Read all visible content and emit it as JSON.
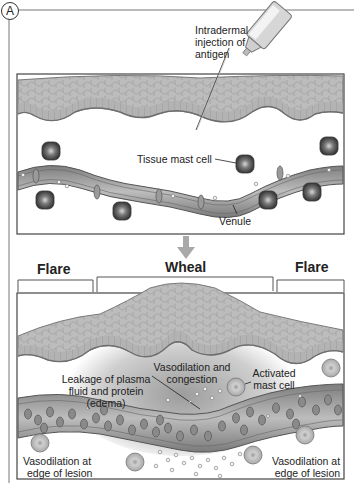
{
  "panel": {
    "letter": "A"
  },
  "top_diagram": {
    "labels": {
      "injection": [
        "Intradermal",
        "injection of",
        "antigen"
      ],
      "mast_cell": "Tissue mast cell",
      "venule": "Venule"
    }
  },
  "bottom_diagram": {
    "headers": {
      "flare_left": "Flare",
      "wheal": "Wheal",
      "flare_right": "Flare"
    },
    "labels": {
      "leakage": [
        "Leakage of plasma",
        "fluid and protein",
        "(edema)"
      ],
      "vasodilation_congestion": [
        "Vasodilation and",
        "congestion"
      ],
      "activated_mast_cell": [
        "Activated",
        "mast cell"
      ],
      "edge_left": [
        "Vasodilation at",
        "edge of lesion"
      ],
      "edge_right": [
        "Vasodilation at",
        "edge of lesion"
      ]
    }
  },
  "colors": {
    "skin": "#b9b9b9",
    "skin_dark": "#8a8a8a",
    "vessel": "#9a9a9a",
    "arrow": "#a9a9a9",
    "wheal_fill": "#c8c8c8",
    "frame": "#555555"
  }
}
